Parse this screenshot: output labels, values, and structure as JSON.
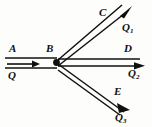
{
  "figure": {
    "type": "physics-flow-junction-diagram",
    "background_color": "#fdfdfb",
    "stroke_color": "#101010",
    "width": 152,
    "height": 127
  },
  "junction": {
    "name": "B",
    "dot_label": "",
    "x": 56,
    "y": 62,
    "radius": 3.2
  },
  "node_labels": {
    "a": "A",
    "b": "B",
    "c": "C",
    "d": "D",
    "e": "E"
  },
  "flow_labels": {
    "q_in": "Q",
    "q1": "Q",
    "q1_sub": "1",
    "q2": "Q",
    "q2_sub": "2",
    "q3": "Q",
    "q3_sub": "3"
  },
  "channels": [
    {
      "id": "inlet-AB",
      "node_label": "A",
      "flow_label": "Q",
      "direction": "right",
      "description": "incoming channel from left edge to junction B"
    },
    {
      "id": "branch-C-Q1",
      "node_label": "C",
      "flow_label": "Q1",
      "direction": "up-right",
      "description": "upper outgoing branch toward C with flow Q1"
    },
    {
      "id": "branch-D-Q2",
      "node_label": "D",
      "flow_label": "Q2",
      "direction": "right",
      "description": "middle horizontal outgoing branch toward D with flow Q2"
    },
    {
      "id": "branch-E-Q3",
      "node_label": "E",
      "flow_label": "Q3",
      "direction": "down-right",
      "description": "lower outgoing branch toward E with flow Q3"
    }
  ]
}
